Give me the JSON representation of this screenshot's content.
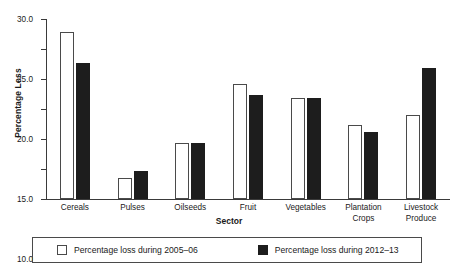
{
  "chart_data": {
    "type": "bar",
    "title": "",
    "xlabel": "Sector",
    "ylabel": "Percentage Loss",
    "categories": [
      "Cereals",
      "Pulses",
      "Oilseeds",
      "Fruit",
      "Vegetables",
      "Plantation Crops",
      "Livestock Produce"
    ],
    "series": [
      {
        "name": "Percentage loss during 2005–06",
        "color": "#ffffff",
        "values": [
          27.8,
          3.5,
          9.3,
          19.2,
          16.8,
          12.3,
          14.0
        ]
      },
      {
        "name": "Percentage loss during 2012–13",
        "color": "#1d1d1d",
        "values": [
          22.7,
          4.7,
          9.4,
          17.4,
          16.8,
          11.1,
          21.8
        ]
      }
    ],
    "ylim": [
      0.0,
      30.0
    ],
    "yticks": [
      0.0,
      5.0,
      10.0,
      15.0,
      20.0,
      25.0,
      30.0
    ],
    "ytick_labels": [
      "0.0",
      "5.0",
      "10.0",
      "15.0",
      "20.0",
      "25.0",
      "30.0"
    ],
    "grid": false,
    "legend_position": "bottom"
  },
  "legend": {
    "items": [
      {
        "label": "Percentage loss during 2005–06"
      },
      {
        "label": "Percentage loss during 2012–13"
      }
    ]
  }
}
